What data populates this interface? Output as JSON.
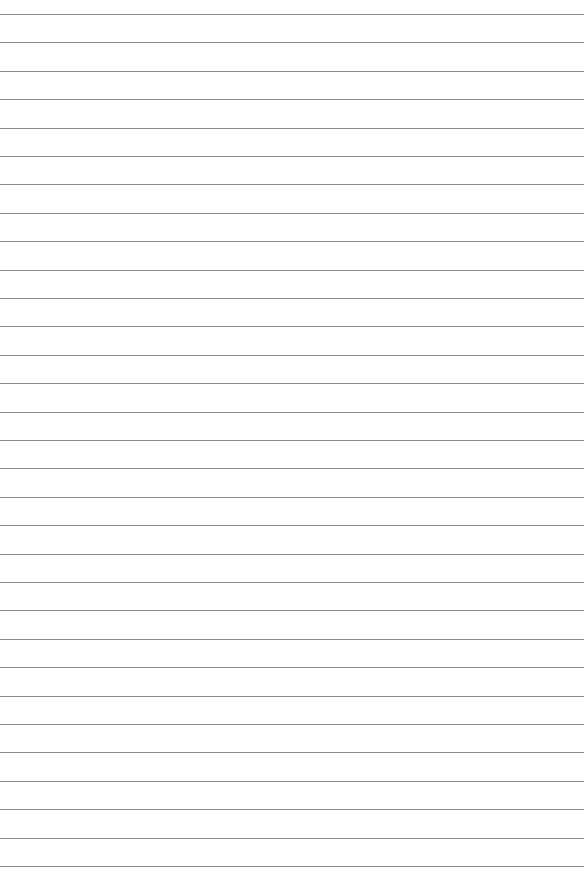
{
  "page": {
    "type": "lined-paper",
    "background_color": "#ffffff",
    "line_color": "#8a8a8a",
    "line_count": 31,
    "first_line_y": 14,
    "line_spacing": 28.4,
    "line_width": 584
  }
}
